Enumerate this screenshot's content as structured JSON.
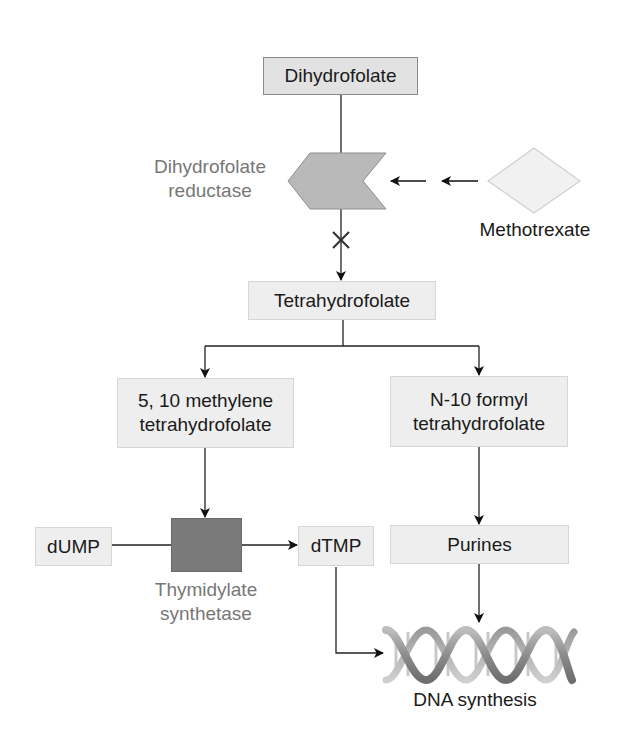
{
  "diagram": {
    "nodes": {
      "dihydrofolate": "Dihydrofolate",
      "dhfr_label_line1": "Dihydrofolate",
      "dhfr_label_line2": "reductase",
      "methotrexate": "Methotrexate",
      "tetrahydrofolate": "Tetrahydrofolate",
      "methylene_line1": "5, 10 methylene",
      "methylene_line2": "tetrahydrofolate",
      "formyl_line1": "N-10 formyl",
      "formyl_line2": "tetrahydrofolate",
      "dump": "dUMP",
      "dtmp": "dTMP",
      "thymidylate_line1": "Thymidylate",
      "thymidylate_line2": "synthetase",
      "purines": "Purines",
      "dna_synthesis": "DNA synthesis"
    },
    "edges": [
      {
        "from": "Dihydrofolate",
        "to": "Dihydrofolate reductase",
        "type": "line"
      },
      {
        "from": "Dihydrofolate reductase",
        "to": "Tetrahydrofolate",
        "type": "arrow",
        "blocked": true
      },
      {
        "from": "Methotrexate",
        "to": "Dihydrofolate reductase",
        "type": "inhibition-arrows"
      },
      {
        "from": "Tetrahydrofolate",
        "to": "5, 10 methylene tetrahydrofolate",
        "type": "arrow"
      },
      {
        "from": "Tetrahydrofolate",
        "to": "N-10 formyl tetrahydrofolate",
        "type": "arrow"
      },
      {
        "from": "5, 10 methylene tetrahydrofolate",
        "to": "Thymidylate synthetase",
        "type": "arrow"
      },
      {
        "from": "dUMP",
        "to": "Thymidylate synthetase",
        "type": "line"
      },
      {
        "from": "Thymidylate synthetase",
        "to": "dTMP",
        "type": "arrow"
      },
      {
        "from": "N-10 formyl tetrahydrofolate",
        "to": "Purines",
        "type": "arrow"
      },
      {
        "from": "Purines",
        "to": "DNA synthesis",
        "type": "arrow"
      },
      {
        "from": "dTMP",
        "to": "DNA synthesis",
        "type": "arrow"
      }
    ],
    "colors": {
      "box_fill": "#eeeeee",
      "enzyme_dhfr": "#b9b9b9",
      "enzyme_ts": "#7a7a7a",
      "methotrexate_fill": "#f0f0f0",
      "enzyme_label": "#777777"
    },
    "icons": {
      "block_mark": "x-block-icon",
      "dna": "dna-helix-icon"
    }
  }
}
